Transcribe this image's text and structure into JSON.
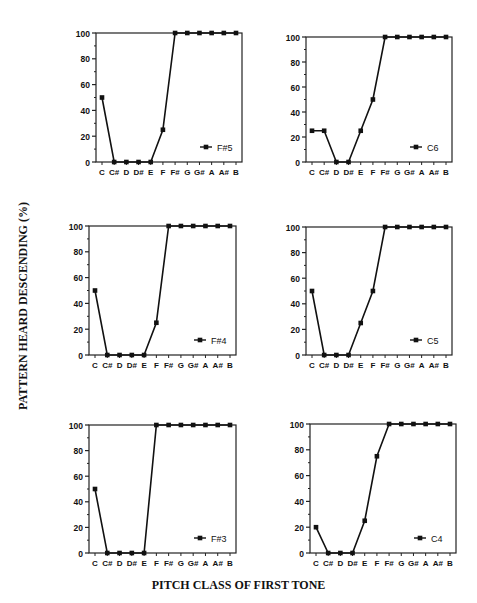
{
  "figure": {
    "ylabel": "PATTERN HEARD DESCENDING (%)",
    "xlabel": "PITCH CLASS OF FIRST TONE"
  },
  "chart_data": [
    {
      "type": "line",
      "title": "",
      "legend": "F#5",
      "legend_position": "lower right",
      "categories": [
        "C",
        "C#",
        "D",
        "D#",
        "E",
        "F",
        "F#",
        "G",
        "G#",
        "A",
        "A#",
        "B"
      ],
      "values": [
        50,
        0,
        0,
        0,
        0,
        25,
        100,
        100,
        100,
        100,
        100,
        100
      ],
      "xlabel": "",
      "ylabel": "",
      "ylim": [
        0,
        100
      ],
      "yticks": [
        0,
        20,
        40,
        60,
        80,
        100
      ],
      "grid": false,
      "layout": {
        "x0": 96,
        "x1": 242,
        "ytop": 33,
        "ybot": 162
      }
    },
    {
      "type": "line",
      "title": "",
      "legend": "C6",
      "legend_position": "lower right",
      "categories": [
        "C",
        "C#",
        "D",
        "D#",
        "E",
        "F",
        "F#",
        "G",
        "G#",
        "A",
        "A#",
        "B"
      ],
      "values": [
        25,
        25,
        0,
        0,
        25,
        50,
        100,
        100,
        100,
        100,
        100,
        100
      ],
      "xlabel": "",
      "ylabel": "",
      "ylim": [
        0,
        100
      ],
      "yticks": [
        0,
        20,
        40,
        60,
        80,
        100
      ],
      "grid": false,
      "layout": {
        "x0": 306,
        "x1": 452,
        "ytop": 37,
        "ybot": 162
      }
    },
    {
      "type": "line",
      "title": "",
      "legend": "F#4",
      "legend_position": "lower right",
      "categories": [
        "C",
        "C#",
        "D",
        "D#",
        "E",
        "F",
        "F#",
        "G",
        "G#",
        "A",
        "A#",
        "B"
      ],
      "values": [
        50,
        0,
        0,
        0,
        0,
        25,
        100,
        100,
        100,
        100,
        100,
        100
      ],
      "xlabel": "",
      "ylabel": "",
      "ylim": [
        0,
        100
      ],
      "yticks": [
        0,
        20,
        40,
        60,
        80,
        100
      ],
      "grid": false,
      "layout": {
        "x0": 89,
        "x1": 236,
        "ytop": 226,
        "ybot": 355
      }
    },
    {
      "type": "line",
      "title": "",
      "legend": "C5",
      "legend_position": "lower right",
      "categories": [
        "C",
        "C#",
        "D",
        "D#",
        "E",
        "F",
        "F#",
        "G",
        "G#",
        "A",
        "A#",
        "B"
      ],
      "values": [
        50,
        0,
        0,
        0,
        25,
        50,
        100,
        100,
        100,
        100,
        100,
        100
      ],
      "xlabel": "",
      "ylabel": "",
      "ylim": [
        0,
        100
      ],
      "yticks": [
        0,
        20,
        40,
        60,
        80,
        100
      ],
      "grid": false,
      "layout": {
        "x0": 306,
        "x1": 452,
        "ytop": 227,
        "ybot": 355
      }
    },
    {
      "type": "line",
      "title": "",
      "legend": "F#3",
      "legend_position": "lower right",
      "categories": [
        "C",
        "C#",
        "D",
        "D#",
        "E",
        "F",
        "F#",
        "G",
        "G#",
        "A",
        "A#",
        "B"
      ],
      "values": [
        50,
        0,
        0,
        0,
        0,
        100,
        100,
        100,
        100,
        100,
        100,
        100
      ],
      "xlabel": "",
      "ylabel": "",
      "ylim": [
        0,
        100
      ],
      "yticks": [
        0,
        20,
        40,
        60,
        80,
        100
      ],
      "grid": false,
      "layout": {
        "x0": 89,
        "x1": 236,
        "ytop": 425,
        "ybot": 553
      }
    },
    {
      "type": "line",
      "title": "",
      "legend": "C4",
      "legend_position": "lower right",
      "categories": [
        "C",
        "C#",
        "D",
        "D#",
        "E",
        "F",
        "F#",
        "G",
        "G#",
        "A",
        "A#",
        "B"
      ],
      "values": [
        20,
        0,
        0,
        0,
        25,
        75,
        100,
        100,
        100,
        100,
        100,
        100
      ],
      "xlabel": "",
      "ylabel": "",
      "ylim": [
        0,
        100
      ],
      "yticks": [
        0,
        20,
        40,
        60,
        80,
        100
      ],
      "grid": false,
      "layout": {
        "x0": 310,
        "x1": 456,
        "ytop": 424,
        "ybot": 553
      }
    }
  ],
  "style": {
    "line_color": "#111111",
    "axis_color": "#222222",
    "text_color": "#111111",
    "background": "#ffffff"
  }
}
